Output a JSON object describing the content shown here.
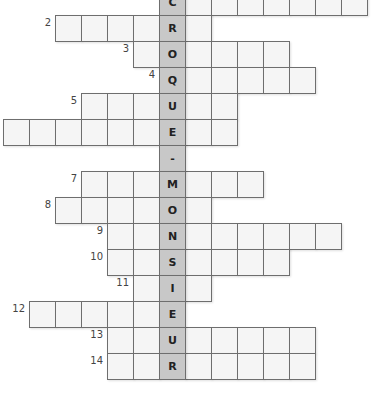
{
  "puzzle": {
    "type": "crossword",
    "solution_column_word": "CROQUE-MONSIEUR",
    "key_column": 6,
    "cell_size": 26,
    "origin": {
      "x": 3,
      "y": -11
    },
    "colors": {
      "cell_bg": "#f5f5f5",
      "key_bg": "#c8c8c8",
      "border": "#6e6e6e"
    },
    "rows": [
      {
        "row": 0,
        "number": "1",
        "start": 6,
        "end": 13,
        "letter": "C"
      },
      {
        "row": 1,
        "number": "2",
        "start": 2,
        "end": 7,
        "letter": "R"
      },
      {
        "row": 2,
        "number": "3",
        "start": 5,
        "end": 10,
        "letter": "O"
      },
      {
        "row": 3,
        "number": "4",
        "start": 6,
        "end": 11,
        "letter": "Q"
      },
      {
        "row": 4,
        "number": "5",
        "start": 3,
        "end": 8,
        "letter": "U"
      },
      {
        "row": 5,
        "number": "",
        "start": 0,
        "end": 8,
        "letter": "E"
      },
      {
        "row": 6,
        "number": "",
        "start": 6,
        "end": 6,
        "letter": "-"
      },
      {
        "row": 7,
        "number": "7",
        "start": 3,
        "end": 9,
        "letter": "M"
      },
      {
        "row": 8,
        "number": "8",
        "start": 2,
        "end": 7,
        "letter": "O"
      },
      {
        "row": 9,
        "number": "9",
        "start": 4,
        "end": 12,
        "letter": "N"
      },
      {
        "row": 10,
        "number": "10",
        "start": 4,
        "end": 10,
        "letter": "S"
      },
      {
        "row": 11,
        "number": "11",
        "start": 5,
        "end": 7,
        "letter": "I"
      },
      {
        "row": 12,
        "number": "12",
        "start": 1,
        "end": 6,
        "letter": "E"
      },
      {
        "row": 13,
        "number": "13",
        "start": 4,
        "end": 11,
        "letter": "U"
      },
      {
        "row": 14,
        "number": "14",
        "start": 4,
        "end": 11,
        "letter": "R"
      }
    ]
  }
}
